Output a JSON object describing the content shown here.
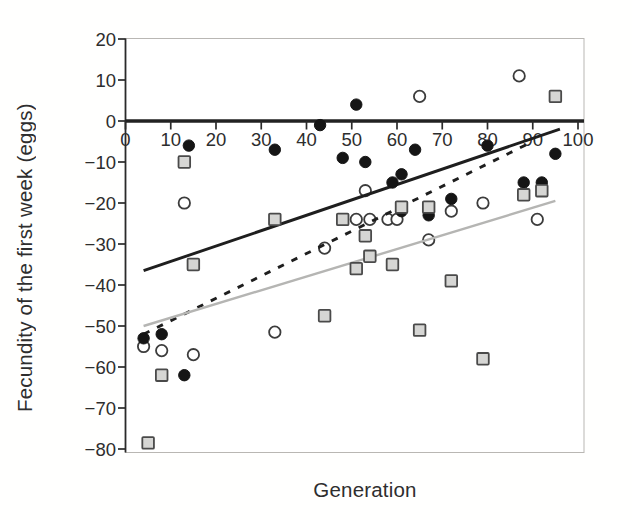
{
  "figure": {
    "background": "#ffffff"
  },
  "chart_data": {
    "type": "scatter",
    "xlabel": "Generation",
    "ylabel": "Fecundity of the first week (eggs)",
    "xlim": [
      0,
      100
    ],
    "ylim": [
      -80,
      20
    ],
    "grid": false,
    "legend": "none",
    "baseline_y": 0,
    "axis_color": "#2a2a2a",
    "frame_color": "#b9b7b3",
    "x_ticks": [
      {
        "v": 0,
        "label": "0"
      },
      {
        "v": 10,
        "label": "10"
      },
      {
        "v": 20,
        "label": "20"
      },
      {
        "v": 30,
        "label": "30"
      },
      {
        "v": 40,
        "label": "40"
      },
      {
        "v": 50,
        "label": "50"
      },
      {
        "v": 60,
        "label": "60"
      },
      {
        "v": 70,
        "label": "70"
      },
      {
        "v": 80,
        "label": "80"
      },
      {
        "v": 90,
        "label": "90"
      },
      {
        "v": 100,
        "label": "100"
      }
    ],
    "y_ticks": [
      {
        "v": 20,
        "label": "20"
      },
      {
        "v": 10,
        "label": "10"
      },
      {
        "v": 0,
        "label": "0"
      },
      {
        "v": -10,
        "label": "−10"
      },
      {
        "v": -20,
        "label": "−20"
      },
      {
        "v": -30,
        "label": "−30"
      },
      {
        "v": -40,
        "label": "−40"
      },
      {
        "v": -50,
        "label": "−50"
      },
      {
        "v": -60,
        "label": "−60"
      },
      {
        "v": -70,
        "label": "−70"
      },
      {
        "v": -80,
        "label": "−80"
      }
    ],
    "series": [
      {
        "name": "white-open-circles",
        "marker": "circle-open",
        "fill": "#ffffff",
        "stroke": "#3c3c3c",
        "points": [
          [
            13,
            -20
          ],
          [
            53,
            -17
          ],
          [
            51,
            -24
          ],
          [
            54,
            -24
          ],
          [
            58,
            -24
          ],
          [
            60,
            -24
          ],
          [
            44,
            -31
          ],
          [
            67,
            -29
          ],
          [
            72,
            -22
          ],
          [
            79,
            -20
          ],
          [
            91,
            -24
          ],
          [
            65,
            6
          ],
          [
            87,
            11
          ],
          [
            33,
            -51.5
          ],
          [
            4,
            -55
          ],
          [
            8,
            -56
          ],
          [
            15,
            -57
          ]
        ]
      },
      {
        "name": "black-filled-circles",
        "marker": "circle-filled",
        "fill": "#151515",
        "stroke": "#151515",
        "points": [
          [
            14,
            -6
          ],
          [
            33,
            -7
          ],
          [
            43,
            -1
          ],
          [
            48,
            -9
          ],
          [
            51,
            4
          ],
          [
            53,
            -10
          ],
          [
            59,
            -15
          ],
          [
            61,
            -13
          ],
          [
            64,
            -7
          ],
          [
            61,
            -22
          ],
          [
            67,
            -23
          ],
          [
            72,
            -19
          ],
          [
            80,
            -6
          ],
          [
            88,
            -15
          ],
          [
            92,
            -15
          ],
          [
            95,
            -8
          ],
          [
            4,
            -53
          ],
          [
            8,
            -52
          ],
          [
            13,
            -62
          ]
        ]
      },
      {
        "name": "gray-squares",
        "marker": "square",
        "fill": "#d6d6d4",
        "stroke": "#4a4a4a",
        "points": [
          [
            13,
            -10
          ],
          [
            15,
            -35
          ],
          [
            33,
            -24
          ],
          [
            44,
            -47.5
          ],
          [
            48,
            -24
          ],
          [
            51,
            -36
          ],
          [
            53,
            -28
          ],
          [
            54,
            -33
          ],
          [
            59,
            -35
          ],
          [
            61,
            -21
          ],
          [
            67,
            -21
          ],
          [
            72,
            -39
          ],
          [
            65,
            -51
          ],
          [
            79,
            -58
          ],
          [
            88,
            -18
          ],
          [
            92,
            -17
          ],
          [
            95,
            6
          ],
          [
            8,
            -62
          ],
          [
            5,
            -78.5
          ]
        ]
      }
    ],
    "trend_lines": [
      {
        "name": "solid-black-line",
        "style": "solid",
        "color": "#1e1e1e",
        "width": 2.9,
        "from": [
          4,
          -36.5
        ],
        "to": [
          96,
          -2
        ]
      },
      {
        "name": "dashed-black-line",
        "style": "dashed",
        "color": "#1e1e1e",
        "width": 2.9,
        "from": [
          4,
          -52
        ],
        "to": [
          90,
          -5
        ]
      },
      {
        "name": "solid-gray-line",
        "style": "solid",
        "color": "#b5b5b3",
        "width": 2.4,
        "from": [
          4,
          -50
        ],
        "to": [
          95,
          -19.5
        ]
      }
    ]
  }
}
